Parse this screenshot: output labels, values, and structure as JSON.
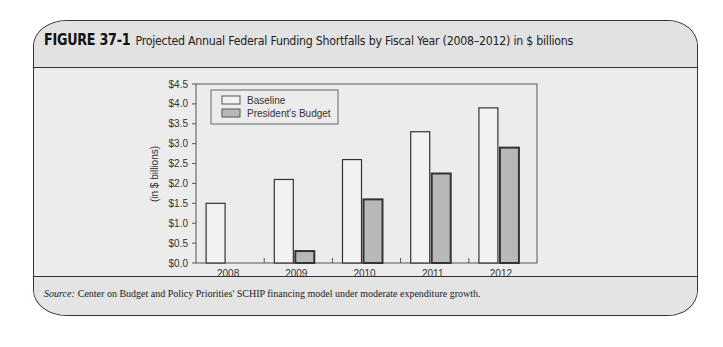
{
  "figure": {
    "label": "FIGURE 37-1",
    "title": "Projected Annual Federal Funding Shortfalls by Fiscal Year (2008–2012) in $ billions",
    "source_label": "Source:",
    "source_text": "Center on Budget and Policy Priorities' SCHIP financing model under moderate expenditure growth."
  },
  "chart_data": {
    "type": "bar",
    "title": "Projected Annual Federal Funding Shortfalls by Fiscal Year (2008–2012) in $ billions",
    "xlabel": "",
    "ylabel": "(in $ billions)",
    "categories": [
      "2008",
      "2009",
      "2010",
      "2011",
      "2012"
    ],
    "series": [
      {
        "name": "Baseline",
        "values": [
          1.5,
          2.1,
          2.6,
          3.3,
          3.9
        ],
        "color": "#f2f2f2"
      },
      {
        "name": "President's Budget",
        "values": [
          0,
          0.3,
          1.6,
          2.25,
          2.9
        ],
        "color": "#b8b8b8"
      }
    ],
    "yticks": [
      "$0.0",
      "$0.5",
      "$1.0",
      "$1.5",
      "$2.0",
      "$2.5",
      "$3.0",
      "$3.5",
      "$4.0",
      "$4.5"
    ],
    "ylim": [
      0,
      4.5
    ],
    "grid": false,
    "legend_position": "upper-left-inside"
  }
}
